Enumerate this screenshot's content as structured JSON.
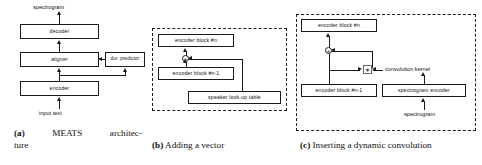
{
  "figure": {
    "panels": [
      {
        "id": "a",
        "caption_tag": "(a)",
        "caption_text": "MEATS architecture",
        "caption_word1": "MEATS",
        "caption_word2": "architec-",
        "caption_word3": "ture",
        "nodes": {
          "output_label": "spectrogram",
          "decoder": "decoder",
          "aligner": "aligner",
          "dur_predictor": "dur. predictor",
          "encoder": "encoder",
          "input_label": "input text"
        }
      },
      {
        "id": "b",
        "caption_tag": "(b)",
        "caption_text": "Adding a vector",
        "nodes": {
          "encoder_block_n": "encoder block #n",
          "encoder_block_n_minus_1": "encoder block #n-1",
          "speaker_table": "speaker look-up table",
          "add_op": "+"
        }
      },
      {
        "id": "c",
        "caption_tag": "(c)",
        "caption_text": "Inserting a dynamic convolution",
        "nodes": {
          "encoder_block_n": "encoder block #n",
          "encoder_block_n_minus_1": "encoder block #n-1",
          "conv_kernel_label": "convolution kernel",
          "spectrogram_encoder": "spectrogram encoder",
          "input_label": "spectrogram",
          "add_op": "+",
          "conv_op": "∗"
        }
      }
    ]
  },
  "colors": {
    "stroke": "#1a1a1a",
    "background": "#ffffff",
    "op_border": "#666666"
  }
}
